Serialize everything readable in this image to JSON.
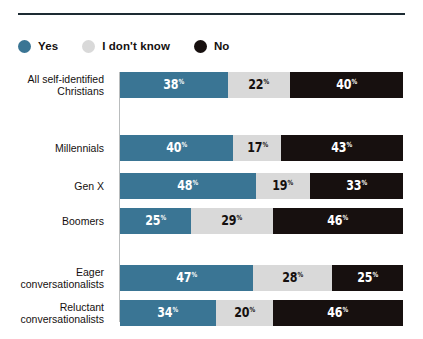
{
  "legend": {
    "items": [
      {
        "label": "Yes",
        "color": "#3a7594",
        "icon": "circle-icon"
      },
      {
        "label": "I don't know",
        "color": "#d9d9d9",
        "icon": "circle-icon"
      },
      {
        "label": "No",
        "color": "#17100f",
        "icon": "circle-icon"
      }
    ]
  },
  "chart_data": {
    "type": "bar",
    "title": "",
    "subtitle": "",
    "xlabel": "",
    "ylabel": "",
    "orientation": "horizontal",
    "stacked": true,
    "stack_total": 100,
    "xlim": [
      0,
      100
    ],
    "grid": false,
    "legend_position": "top-left",
    "value_suffix": "%",
    "categories": [
      "All self-identified\nChristians",
      "Millennials",
      "Gen X",
      "Boomers",
      "Eager\nconversationalists",
      "Reluctant\nconversationalists"
    ],
    "series": [
      {
        "name": "Yes",
        "color": "#3a7594",
        "text_color": "#ffffff",
        "values": [
          38,
          40,
          48,
          25,
          47,
          34
        ]
      },
      {
        "name": "I don't know",
        "color": "#d9d9d9",
        "text_color": "#15100f",
        "values": [
          22,
          17,
          19,
          29,
          28,
          20
        ]
      },
      {
        "name": "No",
        "color": "#17100f",
        "text_color": "#ffffff",
        "values": [
          40,
          43,
          33,
          46,
          25,
          46
        ]
      }
    ],
    "rows": [
      {
        "label": "All self-identified\nChristians",
        "top": 4,
        "cells": [
          {
            "series": "Yes",
            "value": 38,
            "display": "38",
            "suffix": "%",
            "color": "#3a7594",
            "text_color": "#ffffff"
          },
          {
            "series": "I don't know",
            "value": 22,
            "display": "22",
            "suffix": "%",
            "color": "#d9d9d9",
            "text_color": "#15100f"
          },
          {
            "series": "No",
            "value": 40,
            "display": "40",
            "suffix": "%",
            "color": "#17100f",
            "text_color": "#ffffff"
          }
        ]
      },
      {
        "label": "Millennials",
        "top": 67,
        "cells": [
          {
            "series": "Yes",
            "value": 40,
            "display": "40",
            "suffix": "%",
            "color": "#3a7594",
            "text_color": "#ffffff"
          },
          {
            "series": "I don't know",
            "value": 17,
            "display": "17",
            "suffix": "%",
            "color": "#d9d9d9",
            "text_color": "#15100f"
          },
          {
            "series": "No",
            "value": 43,
            "display": "43",
            "suffix": "%",
            "color": "#17100f",
            "text_color": "#ffffff"
          }
        ]
      },
      {
        "label": "Gen X",
        "top": 105,
        "cells": [
          {
            "series": "Yes",
            "value": 48,
            "display": "48",
            "suffix": "%",
            "color": "#3a7594",
            "text_color": "#ffffff"
          },
          {
            "series": "I don't know",
            "value": 19,
            "display": "19",
            "suffix": "%",
            "color": "#d9d9d9",
            "text_color": "#15100f"
          },
          {
            "series": "No",
            "value": 33,
            "display": "33",
            "suffix": "%",
            "color": "#17100f",
            "text_color": "#ffffff"
          }
        ]
      },
      {
        "label": "Boomers",
        "top": 140,
        "cells": [
          {
            "series": "Yes",
            "value": 25,
            "display": "25",
            "suffix": "%",
            "color": "#3a7594",
            "text_color": "#ffffff"
          },
          {
            "series": "I don't know",
            "value": 29,
            "display": "29",
            "suffix": "%",
            "color": "#d9d9d9",
            "text_color": "#15100f"
          },
          {
            "series": "No",
            "value": 46,
            "display": "46",
            "suffix": "%",
            "color": "#17100f",
            "text_color": "#ffffff"
          }
        ]
      },
      {
        "label": "Eager\nconversationalists",
        "top": 197,
        "cells": [
          {
            "series": "Yes",
            "value": 47,
            "display": "47",
            "suffix": "%",
            "color": "#3a7594",
            "text_color": "#ffffff"
          },
          {
            "series": "I don't know",
            "value": 28,
            "display": "28",
            "suffix": "%",
            "color": "#d9d9d9",
            "text_color": "#15100f"
          },
          {
            "series": "No",
            "value": 25,
            "display": "25",
            "suffix": "%",
            "color": "#17100f",
            "text_color": "#ffffff"
          }
        ]
      },
      {
        "label": "Reluctant\nconversationalists",
        "top": 232,
        "cells": [
          {
            "series": "Yes",
            "value": 34,
            "display": "34",
            "suffix": "%",
            "color": "#3a7594",
            "text_color": "#ffffff"
          },
          {
            "series": "I don't know",
            "value": 20,
            "display": "20",
            "suffix": "%",
            "color": "#d9d9d9",
            "text_color": "#15100f"
          },
          {
            "series": "No",
            "value": 46,
            "display": "46",
            "suffix": "%",
            "color": "#17100f",
            "text_color": "#ffffff"
          }
        ]
      }
    ]
  },
  "style": {
    "rule_color": "#1d2b33",
    "axis_color": "#b9bcbd",
    "background": "#ffffff"
  }
}
